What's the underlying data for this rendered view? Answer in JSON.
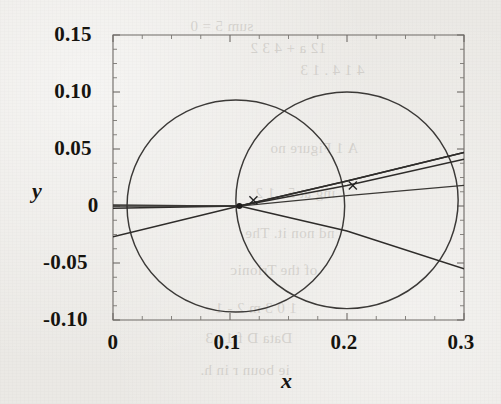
{
  "chart_data": {
    "type": "line",
    "title": "",
    "xlabel": "x",
    "ylabel": "y",
    "xlim": [
      0,
      0.3
    ],
    "ylim": [
      -0.1,
      0.15
    ],
    "grid": false,
    "legend": "none",
    "xticks": [
      "0",
      "0.1",
      "0.2",
      "0.3"
    ],
    "xtick_values": [
      0,
      0.1,
      0.2,
      0.3
    ],
    "xminor_step": 0.025,
    "yticks": [
      "0.15",
      "0.10",
      "0.05",
      "0",
      "-0.05",
      "-0.10"
    ],
    "ytick_values": [
      0.15,
      0.1,
      0.05,
      0,
      -0.05,
      -0.1
    ],
    "yminor_step": 0.0125,
    "series": [
      {
        "name": "circle-left",
        "type": "circle",
        "center": [
          0.105,
          0.0
        ],
        "radius": 0.093,
        "points": []
      },
      {
        "name": "circle-right",
        "type": "circle",
        "center": [
          0.2,
          0.005
        ],
        "radius": 0.095,
        "points": []
      },
      {
        "name": "branch-upper",
        "type": "line",
        "x": [
          0.0,
          0.108,
          0.2,
          0.3
        ],
        "y": [
          0.0,
          0.0,
          0.022,
          0.047
        ]
      },
      {
        "name": "branch-middle",
        "type": "line",
        "x": [
          0.0,
          0.108,
          0.2,
          0.3
        ],
        "y": [
          -0.002,
          0.0,
          0.018,
          0.041
        ]
      },
      {
        "name": "branch-flat",
        "type": "line",
        "x": [
          0.0,
          0.108,
          0.2,
          0.3
        ],
        "y": [
          0.001,
          0.0,
          0.009,
          0.018
        ]
      },
      {
        "name": "branch-rising-from-left",
        "type": "line",
        "x": [
          0.0,
          0.108,
          0.2,
          0.3
        ],
        "y": [
          -0.027,
          0.0,
          0.022,
          0.047
        ]
      },
      {
        "name": "branch-descending",
        "type": "line",
        "x": [
          0.108,
          0.2,
          0.3
        ],
        "y": [
          0.0,
          -0.022,
          -0.055
        ]
      }
    ],
    "markers": [
      {
        "name": "cross-marker-left",
        "x": 0.12,
        "y": 0.005,
        "symbol": "x"
      },
      {
        "name": "cross-marker-right",
        "x": 0.205,
        "y": 0.018,
        "symbol": "x"
      },
      {
        "name": "node-point",
        "x": 0.108,
        "y": 0.0,
        "symbol": "dot"
      }
    ]
  },
  "bleed_text": [
    {
      "text": "sum 5 = 0",
      "x": 190,
      "y": 18
    },
    {
      "text": "12 a + 4 3 2",
      "x": 250,
      "y": 40
    },
    {
      "text": "4 1 4 . 1 3",
      "x": 300,
      "y": 62
    },
    {
      "text": "A 1 Figure no",
      "x": 270,
      "y": 140
    },
    {
      "text": "ing at 5 . 1 2",
      "x": 255,
      "y": 185
    },
    {
      "text": "nd non it. The",
      "x": 245,
      "y": 225
    },
    {
      "text": "of the Trionic",
      "x": 230,
      "y": 262
    },
    {
      "text": "1 0 3 m 2 - 1",
      "x": 215,
      "y": 300
    },
    {
      "text": "Data D f 1 . 3",
      "x": 205,
      "y": 330
    },
    {
      "text": "ie boun r in h.",
      "x": 200,
      "y": 362
    }
  ],
  "colors": {
    "background": "#ebe9e5",
    "ink": "#1d1b1a",
    "axis": "#6e6a66",
    "curve": "#2e2c2a"
  }
}
